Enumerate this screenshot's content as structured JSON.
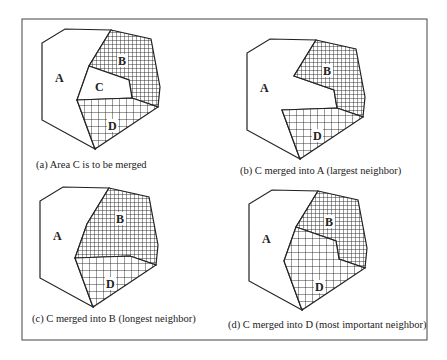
{
  "figure": {
    "panels": [
      {
        "id": "a",
        "caption": "(a)  Area C is to be merged",
        "labels": {
          "A": "A",
          "B": "B",
          "C": "C",
          "D": "D"
        }
      },
      {
        "id": "b",
        "caption": "(b) C merged into A (largest neighbor)",
        "labels": {
          "A": "A",
          "B": "B",
          "D": "D"
        }
      },
      {
        "id": "c",
        "caption": "(c) C merged into B (longest neighbor)",
        "labels": {
          "A": "A",
          "B": "B",
          "D": "D"
        }
      },
      {
        "id": "d",
        "caption": "(d) C merged into D (most important neighbor)",
        "labels": {
          "A": "A",
          "B": "B",
          "D": "D"
        }
      }
    ]
  }
}
